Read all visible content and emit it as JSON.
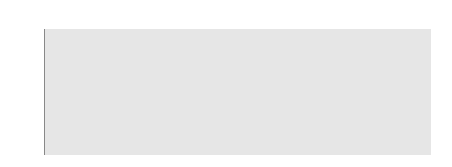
{
  "chart_data": {
    "type": "scatter",
    "xlabel": "",
    "ylabel": "",
    "ylim": [
      -0.6,
      0.6
    ],
    "yticks": [
      "0.60",
      "0.40",
      "0.20",
      "0.00",
      "-0.20",
      "-0.40",
      "-0.60"
    ],
    "grid": false,
    "legend": null,
    "error_bars": true,
    "points": [
      {
        "label": "Number",
        "value": 0.07,
        "err_low": 0.02,
        "err_high": 0.12,
        "label_pos": "above"
      },
      {
        "label": "Geometry",
        "value": 0.15,
        "err_low": 0.08,
        "err_high": 0.21,
        "label_pos": "above"
      },
      {
        "label": "Measurement",
        "value": -0.17,
        "err_low": -0.22,
        "err_high": -0.11,
        "label_pos": "below"
      },
      {
        "label": "Algebra",
        "value": 0.22,
        "err_low": 0.18,
        "err_high": 0.27,
        "label_pos": "above"
      },
      {
        "label": "Data",
        "value": -0.4,
        "err_low": -0.47,
        "err_high": -0.33,
        "label_pos": "below"
      }
    ],
    "colors": {
      "plot_bg": "#e6e6e6",
      "point": "#111111",
      "zero_line": "#666666"
    }
  }
}
